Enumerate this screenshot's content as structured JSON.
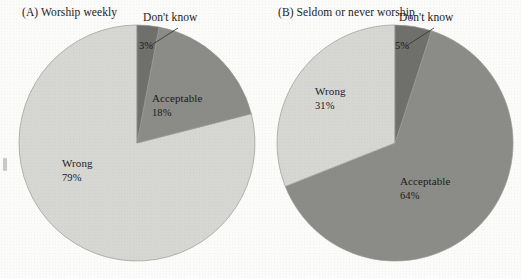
{
  "figure": {
    "background_color": "#fbfbfa",
    "text_color": "#1a1a1a"
  },
  "colors": {
    "wrong": "#d6d6d2",
    "acceptable": "#8b8b88",
    "dont_know": "#6f6f6c",
    "outline": "#9a9a96",
    "leader_line": "#3a3a38"
  },
  "panels": [
    {
      "id": "a",
      "title": "(A)  Worship weekly",
      "callout": "Don't know",
      "labels": {
        "wrong_name": "Wrong",
        "wrong_pct": "79%",
        "acceptable_name": "Acceptable",
        "acceptable_pct": "18%",
        "dont_know_pct": "3%"
      }
    },
    {
      "id": "b",
      "title": "(B)  Seldom or never worship",
      "callout": "Don't know",
      "labels": {
        "wrong_name": "Wrong",
        "wrong_pct": "31%",
        "acceptable_name": "Acceptable",
        "acceptable_pct": "64%",
        "dont_know_pct": "5%"
      }
    }
  ],
  "chart_data": [
    {
      "type": "pie",
      "title": "(A)  Worship weekly",
      "categories": [
        "Don't know",
        "Acceptable",
        "Wrong"
      ],
      "values": [
        3,
        18,
        79
      ],
      "labels": [
        "3%",
        "18%",
        "79%"
      ],
      "colors": [
        "#6f6f6c",
        "#8b8b88",
        "#d6d6d2"
      ],
      "start_angle_deg": 0,
      "direction": "clockwise",
      "units": "percent",
      "legend": "none",
      "grid": false
    },
    {
      "type": "pie",
      "title": "(B)  Seldom or never worship",
      "categories": [
        "Don't know",
        "Acceptable",
        "Wrong"
      ],
      "values": [
        5,
        64,
        31
      ],
      "labels": [
        "5%",
        "64%",
        "31%"
      ],
      "colors": [
        "#6f6f6c",
        "#8b8b88",
        "#d6d6d2"
      ],
      "start_angle_deg": 0,
      "direction": "clockwise",
      "units": "percent",
      "legend": "none",
      "grid": false
    }
  ]
}
